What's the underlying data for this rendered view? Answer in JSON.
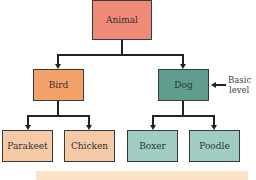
{
  "diagram": {
    "root": {
      "label": "Animal",
      "color": "#ef8a78"
    },
    "level2": [
      {
        "label": "Bird",
        "color": "#f3a36a"
      },
      {
        "label": "Dog",
        "color": "#5f9e8f"
      }
    ],
    "level3": [
      {
        "label": "Parakeet",
        "color": "#f6c9a7"
      },
      {
        "label": "Chicken",
        "color": "#f6c9a7"
      },
      {
        "label": "Boxer",
        "color": "#9fcdc3"
      },
      {
        "label": "Poodle",
        "color": "#9fcdc3"
      }
    ],
    "annotation": {
      "line1": "Basic",
      "line2": "level"
    },
    "caption_bar_color": "#fce3c6"
  }
}
